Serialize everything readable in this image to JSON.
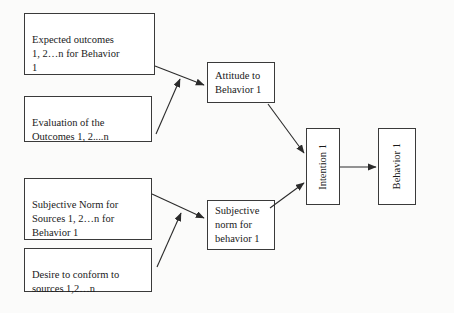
{
  "diagram": {
    "background_color": "#fbfbfa",
    "line_color": "#2b2b2b",
    "box_border_color": "#3a3a3a",
    "box_fill_color": "#ffffff",
    "text_color": "#1a1a1a",
    "nodes": [
      {
        "id": "expected-outcomes",
        "label": "Expected outcomes\n1, 2…n  for Behavior\n1",
        "orientation": "horizontal"
      },
      {
        "id": "evaluation-of-outcomes",
        "label": "Evaluation of the\nOutcomes 1, 2....n",
        "orientation": "horizontal"
      },
      {
        "id": "subjective-norm-sources",
        "label": "Subjective Norm for\nSources 1, 2…n for\nBehavior 1",
        "orientation": "horizontal"
      },
      {
        "id": "desire-to-conform",
        "label": "Desire to conform to\nsources 1,2…n",
        "orientation": "horizontal"
      },
      {
        "id": "attitude-to-behavior",
        "label": "Attitude to\nBehavior 1",
        "orientation": "horizontal"
      },
      {
        "id": "subjective-norm-behavior",
        "label": "Subjective\nnorm  for\nbehavior 1",
        "orientation": "horizontal"
      },
      {
        "id": "intention",
        "label": "Intention 1",
        "orientation": "vertical"
      },
      {
        "id": "behavior",
        "label": "Behavior 1",
        "orientation": "vertical"
      }
    ],
    "edges": [
      {
        "id": "edge-expected-to-attitude",
        "from": "expected-outcomes",
        "to": "attitude-to-behavior"
      },
      {
        "id": "edge-evaluation-to-attitude",
        "from": "evaluation-of-outcomes",
        "to": "attitude-to-behavior"
      },
      {
        "id": "edge-norm-sources-to-norm-behavior",
        "from": "subjective-norm-sources",
        "to": "subjective-norm-behavior"
      },
      {
        "id": "edge-desire-to-norm-behavior",
        "from": "desire-to-conform",
        "to": "subjective-norm-behavior"
      },
      {
        "id": "edge-attitude-to-intention",
        "from": "attitude-to-behavior",
        "to": "intention"
      },
      {
        "id": "edge-norm-behavior-to-intention",
        "from": "subjective-norm-behavior",
        "to": "intention"
      },
      {
        "id": "edge-intention-to-behavior",
        "from": "intention",
        "to": "behavior"
      }
    ]
  }
}
